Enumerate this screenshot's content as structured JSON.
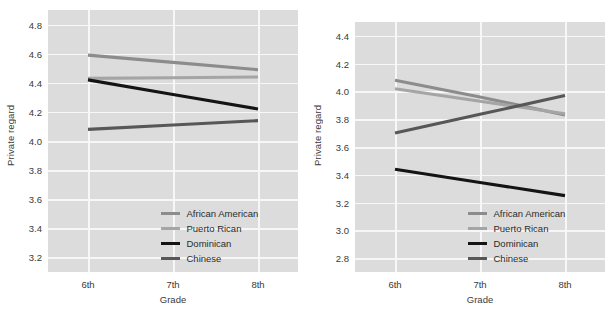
{
  "figure": {
    "panels": [
      {
        "id": "left-panel",
        "ylabel": "Private regard",
        "xlabel": "Grade",
        "yticks": [
          "3.2",
          "3.4",
          "3.6",
          "3.8",
          "4.0",
          "4.2",
          "4.4",
          "4.6",
          "4.8"
        ],
        "xticks": [
          "6th",
          "7th",
          "8th"
        ],
        "legend": [
          {
            "label": "African American",
            "color": "#8c8c8c"
          },
          {
            "label": "Puerto Rican",
            "color": "#a5a5a5"
          },
          {
            "label": "Dominican",
            "color": "#141414"
          },
          {
            "label": "Chinese",
            "color": "#575757"
          }
        ]
      },
      {
        "id": "right-panel",
        "ylabel": "Private regard",
        "xlabel": "Grade",
        "yticks": [
          "2.8",
          "3.0",
          "3.2",
          "3.4",
          "3.6",
          "3.8",
          "4.0",
          "4.2",
          "4.4"
        ],
        "xticks": [
          "6th",
          "7th",
          "8th"
        ],
        "legend": [
          {
            "label": "African American",
            "color": "#8c8c8c"
          },
          {
            "label": "Puerto Rican",
            "color": "#a5a5a5"
          },
          {
            "label": "Dominican",
            "color": "#141414"
          },
          {
            "label": "Chinese",
            "color": "#575757"
          }
        ]
      }
    ]
  },
  "chart_data": [
    {
      "type": "line",
      "panel": "left",
      "title": "",
      "xlabel": "Grade",
      "ylabel": "Private regard",
      "categories": [
        "6th",
        "7th",
        "8th"
      ],
      "ylim": [
        3.1,
        4.9
      ],
      "yticks": [
        3.2,
        3.4,
        3.6,
        3.8,
        4.0,
        4.2,
        4.4,
        4.6,
        4.8
      ],
      "grid": true,
      "legend_position": "bottom-right",
      "series": [
        {
          "name": "African American",
          "color": "#8c8c8c",
          "values": [
            4.59,
            4.54,
            4.49
          ]
        },
        {
          "name": "Puerto Rican",
          "color": "#a5a5a5",
          "values": [
            4.43,
            4.435,
            4.44
          ]
        },
        {
          "name": "Dominican",
          "color": "#141414",
          "values": [
            4.42,
            4.32,
            4.22
          ]
        },
        {
          "name": "Chinese",
          "color": "#575757",
          "values": [
            4.08,
            4.11,
            4.14
          ]
        }
      ]
    },
    {
      "type": "line",
      "panel": "right",
      "title": "",
      "xlabel": "Grade",
      "ylabel": "Private regard",
      "categories": [
        "6th",
        "7th",
        "8th"
      ],
      "ylim": [
        2.7,
        4.5
      ],
      "yticks": [
        2.8,
        3.0,
        3.2,
        3.4,
        3.6,
        3.8,
        4.0,
        4.2,
        4.4
      ],
      "grid": true,
      "legend_position": "bottom-right",
      "series": [
        {
          "name": "African American",
          "color": "#8c8c8c",
          "values": [
            4.08,
            3.96,
            3.83
          ]
        },
        {
          "name": "Puerto Rican",
          "color": "#a5a5a5",
          "values": [
            4.02,
            3.93,
            3.84
          ]
        },
        {
          "name": "Dominican",
          "color": "#141414",
          "values": [
            3.44,
            3.345,
            3.25
          ]
        },
        {
          "name": "Chinese",
          "color": "#575757",
          "values": [
            3.7,
            3.835,
            3.97
          ]
        }
      ]
    }
  ]
}
